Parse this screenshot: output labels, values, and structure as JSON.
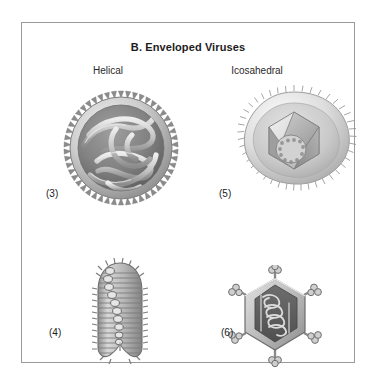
{
  "panel": {
    "title": "B. Enveloped Viruses",
    "border_color": "#9a9a9a",
    "background_color": "#ffffff"
  },
  "columns": [
    {
      "id": "helical",
      "label": "Helical"
    },
    {
      "id": "icosahedral",
      "label": "Icosahedral"
    }
  ],
  "figures": [
    {
      "id": "helical-enveloped",
      "label": "(3)",
      "column": "helical",
      "icon": "enveloped-helical-virus-icon",
      "description": "Spherical enveloped virion with spiked envelope and coiled helical nucleocapsid"
    },
    {
      "id": "icosahedral-enveloped",
      "label": "(5)",
      "column": "icosahedral",
      "icon": "enveloped-icosahedral-virus-icon",
      "description": "Irregular enveloped virion with fine surface spikes enclosing an icosahedral capsid"
    },
    {
      "id": "bullet-shaped",
      "label": "(4)",
      "column": "helical",
      "icon": "bullet-shaped-virus-icon",
      "description": "Bullet-shaped enveloped virion with striated envelope and internal helical coil"
    },
    {
      "id": "hexagonal-spiked",
      "label": "(6)",
      "column": "icosahedral",
      "icon": "hexagonal-spiked-virus-icon",
      "description": "Hexagonal enveloped virion with knobbed vertex spikes and coiled internal genome"
    }
  ],
  "colors": {
    "art_light": "#e8e8e8",
    "art_mid": "#b4b4b4",
    "art_dark": "#8a8a8a",
    "art_darkest": "#5e5e5e",
    "text": "#1c1c1c"
  }
}
